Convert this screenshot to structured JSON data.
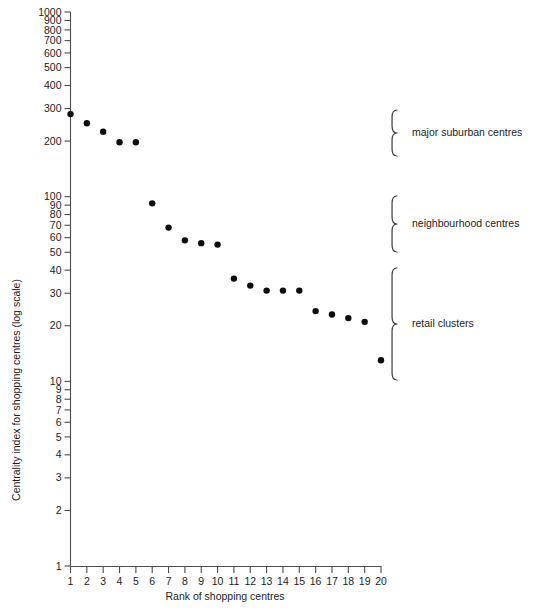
{
  "chart_data": {
    "type": "scatter",
    "title": "",
    "xlabel": "Rank of shopping centres",
    "ylabel": "Centrality index for shopping centres (log scale)",
    "yscale": "log",
    "ylim": [
      1,
      1000
    ],
    "xlim": [
      1,
      20
    ],
    "grid": false,
    "legend": "none",
    "x": [
      1,
      2,
      3,
      4,
      5,
      6,
      7,
      8,
      9,
      10,
      11,
      12,
      13,
      14,
      15,
      16,
      17,
      18,
      19,
      20
    ],
    "values": [
      280,
      250,
      225,
      197,
      197,
      92,
      68,
      58,
      56,
      55,
      36,
      33,
      31,
      31,
      31,
      24,
      23,
      22,
      21,
      13
    ],
    "y_tick_labels": [
      "1000",
      "900",
      "800",
      "700",
      "600",
      "500",
      "400",
      "300",
      "200",
      "100",
      "90",
      "80",
      "70",
      "60",
      "50",
      "40",
      "30",
      "20",
      "10",
      "9",
      "8",
      "7",
      "6",
      "5",
      "4",
      "3",
      "2",
      "1"
    ],
    "y_tick_values": [
      1000,
      900,
      800,
      700,
      600,
      500,
      400,
      300,
      200,
      100,
      90,
      80,
      70,
      60,
      50,
      40,
      30,
      20,
      10,
      9,
      8,
      7,
      6,
      5,
      4,
      3,
      2,
      1
    ],
    "x_tick_labels": [
      "1",
      "2",
      "3",
      "4",
      "5",
      "6",
      "7",
      "8",
      "9",
      "10",
      "11",
      "12",
      "13",
      "14",
      "15",
      "16",
      "17",
      "18",
      "19",
      "20"
    ],
    "annotations": [
      {
        "label": "major suburban centres",
        "rank_range": [
          1,
          5
        ],
        "value_range": [
          197,
          280
        ],
        "bracket_top_px": 110,
        "bracket_bottom_px": 156
      },
      {
        "label": "neighbourhood centres",
        "rank_range": [
          6,
          10
        ],
        "value_range": [
          55,
          92
        ],
        "bracket_top_px": 196,
        "bracket_bottom_px": 252
      },
      {
        "label": "retail clusters",
        "rank_range": [
          11,
          20
        ],
        "value_range": [
          13,
          36
        ],
        "bracket_top_px": 268,
        "bracket_bottom_px": 380
      }
    ]
  },
  "figure": {
    "point_color": "#0d0d0d",
    "axis_color": "#4d4d4d",
    "text_color": "#1c1c1c",
    "background": "#ffffff"
  }
}
